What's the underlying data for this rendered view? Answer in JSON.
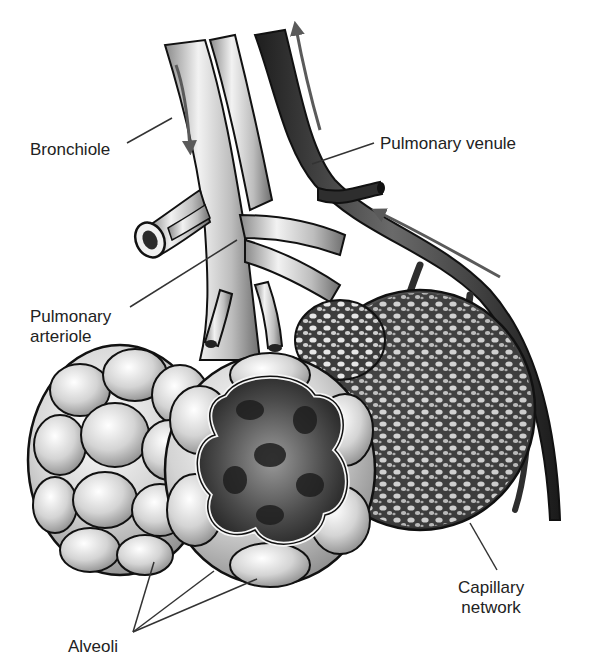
{
  "diagram": {
    "colors": {
      "background": "#ffffff",
      "label_text": "#222222",
      "leader_line": "#333333",
      "outline": "#111111",
      "bronchiole_fill": "#d9d9d9",
      "venule_fill": "#3a3a3a",
      "alveoli_fill": "#cfcfcf",
      "capillary_fill": "#4a4a4a",
      "flow_arrow": "#5a5a5a"
    },
    "labels": {
      "bronchiole": "Bronchiole",
      "pulmonary_venule": "Pulmonary venule",
      "pulmonary_arteriole_line1": "Pulmonary",
      "pulmonary_arteriole_line2": "arteriole",
      "capillary_network_line1": "Capillary",
      "capillary_network_line2": "network",
      "alveoli": "Alveoli"
    },
    "flow_arrows": [
      {
        "name": "bronchiole-downflow-arrow",
        "direction": "down"
      },
      {
        "name": "venule-upflow-arrow",
        "direction": "up"
      },
      {
        "name": "venule-return-arrow",
        "direction": "up-left"
      }
    ]
  }
}
